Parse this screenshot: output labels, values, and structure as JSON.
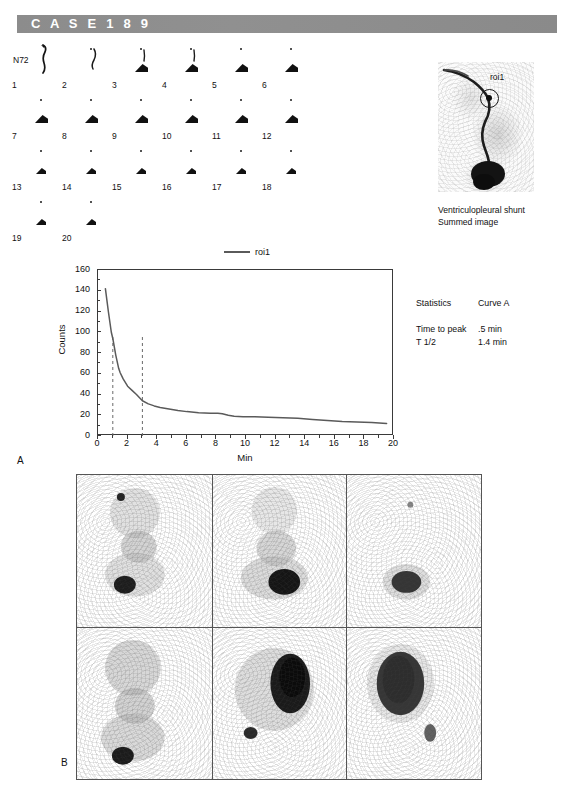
{
  "header": {
    "case_title": "C A S E   1 8 9"
  },
  "frames": {
    "marker_label": "N72",
    "numbers": [
      "1",
      "2",
      "3",
      "4",
      "5",
      "6",
      "7",
      "8",
      "9",
      "10",
      "11",
      "12",
      "13",
      "14",
      "15",
      "16",
      "17",
      "18",
      "19",
      "20"
    ]
  },
  "summed": {
    "roi_label": "roi1",
    "caption_line1": "Ventriculopleural shunt",
    "caption_line2": "Summed image"
  },
  "statistics": {
    "header_left": "Statistics",
    "header_right": "Curve A",
    "rows": [
      {
        "label": "Time to peak",
        "value": ".5 min"
      },
      {
        "label": "T 1/2",
        "value": "1.4 min"
      }
    ]
  },
  "panels": {
    "a_label": "A",
    "b_label": "B"
  },
  "chart_data": {
    "type": "line",
    "title": "",
    "xlabel": "Min",
    "ylabel": "Counts",
    "xlim": [
      0,
      20
    ],
    "ylim": [
      0,
      160
    ],
    "xticks": [
      0,
      2,
      4,
      6,
      8,
      10,
      12,
      14,
      16,
      18,
      20
    ],
    "yticks": [
      0,
      20,
      40,
      60,
      80,
      100,
      120,
      140,
      160
    ],
    "xtick_labels": [
      "0",
      "2",
      "4",
      "6",
      "8",
      "10",
      "12",
      "14",
      "16",
      "18",
      "20"
    ],
    "ytick_labels": [
      "0",
      "20",
      "40",
      "60",
      "80",
      "100",
      "120",
      "140",
      "160"
    ],
    "grid": false,
    "legend_position": "top-center",
    "legend_entries": [
      "roi1"
    ],
    "line_color": "#5a5a5a",
    "markers": {
      "vertical_dashed_lines_x": [
        1,
        3
      ],
      "dash_color": "#6a6a6a"
    },
    "series": [
      {
        "name": "roi1",
        "x": [
          0.5,
          0.7,
          0.9,
          1.0,
          1.2,
          1.4,
          1.5,
          1.7,
          2.0,
          2.3,
          2.6,
          3.0,
          3.4,
          3.8,
          4.2,
          4.8,
          5.4,
          6.0,
          6.8,
          7.6,
          8.1,
          8.4,
          8.8,
          9.2,
          9.8,
          10.6,
          11.5,
          12.5,
          13.5,
          14.5,
          15.5,
          16.5,
          17.5,
          18.5,
          19.5
        ],
        "y": [
          142,
          120,
          100,
          94,
          78,
          65,
          61,
          55,
          48,
          44,
          40,
          34,
          31,
          29,
          27.5,
          26,
          24.5,
          23.5,
          22.5,
          22,
          22,
          21.5,
          20,
          19,
          18.5,
          18.5,
          18,
          17.5,
          17,
          16,
          15,
          14,
          13.5,
          13,
          12
        ]
      }
    ]
  }
}
